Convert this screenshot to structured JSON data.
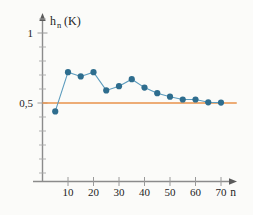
{
  "chart_data": {
    "type": "line",
    "title": "",
    "xlabel": "n",
    "ylabel": "h_n (K)",
    "ylabel_base": "h",
    "ylabel_subscript": "n",
    "ylabel_unit": "(K)",
    "xlim": [
      0,
      75
    ],
    "ylim": [
      0,
      1.08
    ],
    "grid": false,
    "legend": null,
    "x_ticks": [
      10,
      20,
      30,
      40,
      50,
      60,
      70
    ],
    "x_tick_labels": [
      "10",
      "20",
      "30",
      "40",
      "50",
      "60",
      "70"
    ],
    "y_ticks": [
      0.5,
      1
    ],
    "y_tick_labels": [
      "0,5",
      "1"
    ],
    "y_minor_ticks": [
      0.07,
      0.18,
      0.29,
      0.39,
      0.61,
      0.71,
      0.82,
      0.93
    ],
    "series": [
      {
        "name": "h_n",
        "marker": "circle",
        "color": "#2e6d8e",
        "line_color": "#5b9bbd",
        "x": [
          5,
          10,
          15,
          20,
          25,
          30,
          35,
          40,
          45,
          50,
          55,
          60,
          65,
          70
        ],
        "values": [
          0.44,
          0.72,
          0.69,
          0.72,
          0.59,
          0.62,
          0.67,
          0.61,
          0.57,
          0.545,
          0.525,
          0.525,
          0.505,
          0.503
        ]
      }
    ],
    "reference_line": {
      "name": "limit",
      "orientation": "horizontal",
      "value": 0.5,
      "color": "#e8924a",
      "x_start": 0,
      "x_end": 75
    },
    "colors": {
      "marker": "#2e6d8e",
      "line": "#5b9bbd",
      "reference": "#e8924a",
      "axis": "#8b8b8b",
      "text": "#1d1d1d",
      "background": "#fbfbf9"
    }
  }
}
